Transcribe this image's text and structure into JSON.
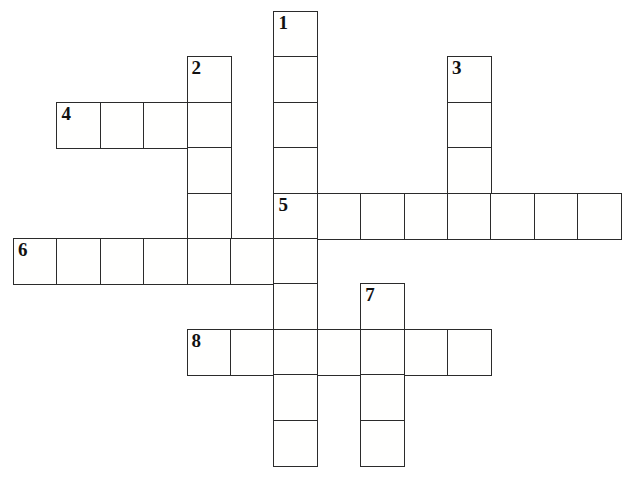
{
  "puzzle": {
    "title": "Crossword Puzzle Grid",
    "kind": "crossword-grid",
    "background_color": "#ffffff",
    "cell_border_color": "#2b2b2b",
    "cell_fill_color": "#fffffe",
    "number_color": "#111111",
    "cell_width": 43.4,
    "cell_height": 45.4,
    "origin_x": 13,
    "origin_y": 11,
    "columns": 15,
    "rows": 10,
    "entries": [
      {
        "number": "1",
        "direction": "down",
        "length": 10,
        "start_col": 6,
        "start_row": 0
      },
      {
        "number": "2",
        "direction": "down",
        "length": 5,
        "start_col": 4,
        "start_row": 1
      },
      {
        "number": "3",
        "direction": "down",
        "length": 4,
        "start_col": 10,
        "start_row": 1
      },
      {
        "number": "4",
        "direction": "across",
        "length": 4,
        "start_col": 1,
        "start_row": 2
      },
      {
        "number": "5",
        "direction": "across",
        "length": 8,
        "start_col": 6,
        "start_row": 4
      },
      {
        "number": "6",
        "direction": "across",
        "length": 7,
        "start_col": 0,
        "start_row": 5
      },
      {
        "number": "7",
        "direction": "down",
        "length": 4,
        "start_col": 8,
        "start_row": 6
      },
      {
        "number": "8",
        "direction": "across",
        "length": 7,
        "start_col": 4,
        "start_row": 7
      }
    ],
    "cells": [
      {
        "col": 6,
        "row": 0,
        "number": "1",
        "glyph": ""
      },
      {
        "col": 6,
        "row": 1,
        "number": "",
        "glyph": ""
      },
      {
        "col": 4,
        "row": 1,
        "number": "2",
        "glyph": ""
      },
      {
        "col": 10,
        "row": 1,
        "number": "3",
        "glyph": ""
      },
      {
        "col": 1,
        "row": 2,
        "number": "4",
        "glyph": ""
      },
      {
        "col": 2,
        "row": 2,
        "number": "",
        "glyph": ""
      },
      {
        "col": 3,
        "row": 2,
        "number": "",
        "glyph": ""
      },
      {
        "col": 4,
        "row": 2,
        "number": "",
        "glyph": ""
      },
      {
        "col": 6,
        "row": 2,
        "number": "",
        "glyph": ""
      },
      {
        "col": 10,
        "row": 2,
        "number": "",
        "glyph": ""
      },
      {
        "col": 4,
        "row": 3,
        "number": "",
        "glyph": ""
      },
      {
        "col": 6,
        "row": 3,
        "number": "",
        "glyph": ""
      },
      {
        "col": 10,
        "row": 3,
        "number": "",
        "glyph": ""
      },
      {
        "col": 4,
        "row": 4,
        "number": "",
        "glyph": ""
      },
      {
        "col": 6,
        "row": 4,
        "number": "5",
        "glyph": ""
      },
      {
        "col": 7,
        "row": 4,
        "number": "",
        "glyph": ""
      },
      {
        "col": 8,
        "row": 4,
        "number": "",
        "glyph": ""
      },
      {
        "col": 9,
        "row": 4,
        "number": "",
        "glyph": ""
      },
      {
        "col": 10,
        "row": 4,
        "number": "",
        "glyph": ""
      },
      {
        "col": 11,
        "row": 4,
        "number": "",
        "glyph": ""
      },
      {
        "col": 12,
        "row": 4,
        "number": "",
        "glyph": ""
      },
      {
        "col": 13,
        "row": 4,
        "number": "",
        "glyph": ""
      },
      {
        "col": 0,
        "row": 5,
        "number": "6",
        "glyph": ""
      },
      {
        "col": 1,
        "row": 5,
        "number": "",
        "glyph": ""
      },
      {
        "col": 2,
        "row": 5,
        "number": "",
        "glyph": ""
      },
      {
        "col": 3,
        "row": 5,
        "number": "",
        "glyph": ""
      },
      {
        "col": 4,
        "row": 5,
        "number": "",
        "glyph": ""
      },
      {
        "col": 5,
        "row": 5,
        "number": "",
        "glyph": ""
      },
      {
        "col": 6,
        "row": 5,
        "number": "",
        "glyph": ""
      },
      {
        "col": 6,
        "row": 6,
        "number": "",
        "glyph": ""
      },
      {
        "col": 8,
        "row": 6,
        "number": "7",
        "glyph": ""
      },
      {
        "col": 4,
        "row": 7,
        "number": "8",
        "glyph": ""
      },
      {
        "col": 5,
        "row": 7,
        "number": "",
        "glyph": ""
      },
      {
        "col": 6,
        "row": 7,
        "number": "",
        "glyph": ""
      },
      {
        "col": 7,
        "row": 7,
        "number": "",
        "glyph": ""
      },
      {
        "col": 8,
        "row": 7,
        "number": "",
        "glyph": ""
      },
      {
        "col": 9,
        "row": 7,
        "number": "",
        "glyph": ""
      },
      {
        "col": 10,
        "row": 7,
        "number": "",
        "glyph": ""
      },
      {
        "col": 6,
        "row": 8,
        "number": "",
        "glyph": ""
      },
      {
        "col": 8,
        "row": 8,
        "number": "",
        "glyph": ""
      },
      {
        "col": 6,
        "row": 9,
        "number": "",
        "glyph": ""
      },
      {
        "col": 8,
        "row": 9,
        "number": "",
        "glyph": ""
      }
    ]
  }
}
